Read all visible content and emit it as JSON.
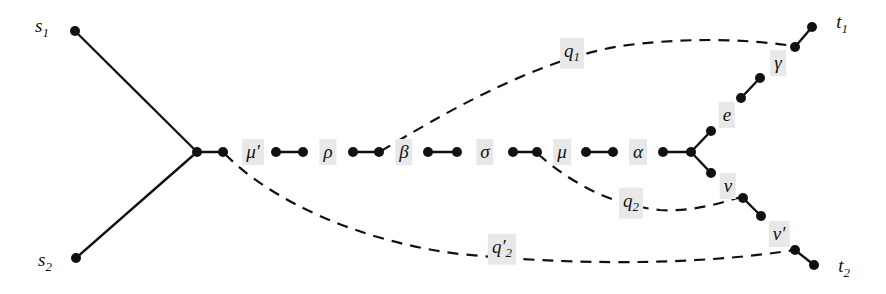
{
  "figure": {
    "type": "graph-diagram",
    "width": 886,
    "height": 294,
    "background_color": "#ffffff",
    "node_color": "#111111",
    "solid_edge_color": "#111111",
    "dashed_edge_color": "#111111",
    "label_background_color": "#e8e8e8"
  },
  "terminals": [
    {
      "id": "s1",
      "text": "s",
      "sub": "1",
      "label_x": 42,
      "label_y": 28,
      "node_x": 75,
      "node_y": 31
    },
    {
      "id": "s2",
      "text": "s",
      "sub": "2",
      "label_x": 45,
      "label_y": 262,
      "node_x": 76,
      "node_y": 258
    },
    {
      "id": "t1",
      "text": "t",
      "sub": "1",
      "label_x": 842,
      "label_y": 24,
      "node_x": 812,
      "node_y": 27
    },
    {
      "id": "t2",
      "text": "t",
      "sub": "2",
      "label_x": 844,
      "label_y": 268,
      "node_x": 814,
      "node_y": 265
    }
  ],
  "edge_labels": [
    {
      "id": "mu-prime",
      "text": "μ′",
      "x": 253,
      "y": 152
    },
    {
      "id": "rho",
      "text": "ρ",
      "x": 328,
      "y": 152
    },
    {
      "id": "beta",
      "text": "β",
      "x": 404,
      "y": 152
    },
    {
      "id": "sigma",
      "text": "σ",
      "x": 485,
      "y": 152
    },
    {
      "id": "mu",
      "text": "μ",
      "x": 562,
      "y": 152
    },
    {
      "id": "alpha",
      "text": "α",
      "x": 638,
      "y": 152
    },
    {
      "id": "e",
      "text": "e",
      "x": 727,
      "y": 115
    },
    {
      "id": "gamma",
      "text": "γ",
      "x": 778,
      "y": 63
    },
    {
      "id": "nu",
      "text": "ν",
      "x": 728,
      "y": 186
    },
    {
      "id": "nu-prime",
      "text": "ν′",
      "x": 779,
      "y": 234
    },
    {
      "id": "q1",
      "text": "q",
      "sub": "1",
      "x": 572,
      "y": 53
    },
    {
      "id": "q2",
      "text": "q",
      "sub": "2",
      "x": 631,
      "y": 203
    },
    {
      "id": "q2-prime",
      "text": "q′",
      "sub": "2",
      "x": 502,
      "y": 249
    }
  ],
  "nodes": [
    {
      "id": "n-s1",
      "x": 75,
      "y": 31
    },
    {
      "id": "n-s2",
      "x": 76,
      "y": 258
    },
    {
      "id": "n-junction",
      "x": 197,
      "y": 152
    },
    {
      "id": "n-c1",
      "x": 223,
      "y": 152
    },
    {
      "id": "n-c2",
      "x": 276,
      "y": 152
    },
    {
      "id": "n-c3",
      "x": 303,
      "y": 152
    },
    {
      "id": "n-c4",
      "x": 353,
      "y": 152
    },
    {
      "id": "n-c5",
      "x": 379,
      "y": 152
    },
    {
      "id": "n-c6",
      "x": 428,
      "y": 152
    },
    {
      "id": "n-c7",
      "x": 457,
      "y": 152
    },
    {
      "id": "n-c8",
      "x": 513,
      "y": 152
    },
    {
      "id": "n-c9",
      "x": 537,
      "y": 152
    },
    {
      "id": "n-c10",
      "x": 586,
      "y": 152
    },
    {
      "id": "n-c11",
      "x": 613,
      "y": 152
    },
    {
      "id": "n-c12",
      "x": 663,
      "y": 152
    },
    {
      "id": "n-fork",
      "x": 691,
      "y": 152
    },
    {
      "id": "n-u1",
      "x": 711,
      "y": 131
    },
    {
      "id": "n-u2",
      "x": 741,
      "y": 98
    },
    {
      "id": "n-u3",
      "x": 760,
      "y": 78
    },
    {
      "id": "n-u4",
      "x": 795,
      "y": 47
    },
    {
      "id": "n-t1",
      "x": 812,
      "y": 27
    },
    {
      "id": "n-l1",
      "x": 711,
      "y": 173
    },
    {
      "id": "n-l2",
      "x": 743,
      "y": 198
    },
    {
      "id": "n-l3",
      "x": 761,
      "y": 216
    },
    {
      "id": "n-l4",
      "x": 795,
      "y": 250
    },
    {
      "id": "n-t2",
      "x": 814,
      "y": 265
    }
  ],
  "solid_edges": [
    {
      "id": "e-s1-junction",
      "from": "n-s1",
      "to": "n-junction"
    },
    {
      "id": "e-s2-junction",
      "from": "n-s2",
      "to": "n-junction"
    },
    {
      "id": "e-junction-c1",
      "from": "n-junction",
      "to": "n-c1"
    },
    {
      "id": "e-c2-c3",
      "from": "n-c2",
      "to": "n-c3"
    },
    {
      "id": "e-c4-c5",
      "from": "n-c4",
      "to": "n-c5"
    },
    {
      "id": "e-c6-c7",
      "from": "n-c6",
      "to": "n-c7"
    },
    {
      "id": "e-c8-c9",
      "from": "n-c8",
      "to": "n-c9"
    },
    {
      "id": "e-c10-c11",
      "from": "n-c10",
      "to": "n-c11"
    },
    {
      "id": "e-c12-fork",
      "from": "n-c12",
      "to": "n-fork"
    },
    {
      "id": "e-fork-u1",
      "from": "n-fork",
      "to": "n-u1"
    },
    {
      "id": "e-u2-u3",
      "from": "n-u2",
      "to": "n-u3"
    },
    {
      "id": "e-u4-t1",
      "from": "n-u4",
      "to": "n-t1"
    },
    {
      "id": "e-fork-l1",
      "from": "n-fork",
      "to": "n-l1"
    },
    {
      "id": "e-l2-l3",
      "from": "n-l2",
      "to": "n-l3"
    },
    {
      "id": "e-l4-t2",
      "from": "n-l4",
      "to": "n-t2"
    }
  ],
  "dashed_edges": [
    {
      "id": "d-q1",
      "label": "q1",
      "path": "M 381 151 C 440 116 530 62 620 46 C 680 38 740 38 793 46"
    },
    {
      "id": "d-q2",
      "label": "q2",
      "path": "M 538 154 C 570 182 610 205 660 210 C 690 212 718 204 741 197"
    },
    {
      "id": "d-q2-prime",
      "label": "q2-prime",
      "path": "M 225 154 C 270 200 360 242 460 254 C 600 268 720 262 794 250"
    }
  ]
}
